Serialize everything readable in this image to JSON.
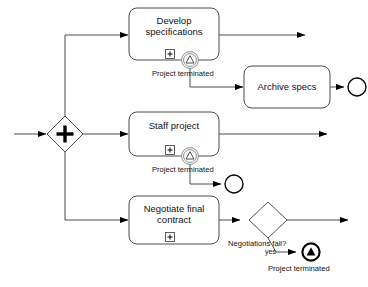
{
  "diagram": {
    "type": "bpmn-process"
  },
  "gateways": [
    {
      "id": "split",
      "name": "parallel-split-gateway",
      "kind": "parallel",
      "marker": "+",
      "label": ""
    },
    {
      "id": "neg_decision",
      "name": "negotiations-fail-gateway",
      "kind": "exclusive",
      "marker": "",
      "label": "Negotiations fail?"
    }
  ],
  "tasks": [
    {
      "id": "develop",
      "name": "develop-specifications-task",
      "label_line1": "Develop",
      "label_line2": "specifications",
      "marker": "+"
    },
    {
      "id": "archive",
      "name": "archive-specs-task",
      "label_line1": "Archive specs",
      "label_line2": "",
      "marker": ""
    },
    {
      "id": "staff",
      "name": "staff-project-task",
      "label_line1": "Staff project",
      "label_line2": "",
      "marker": "+"
    },
    {
      "id": "negotiate",
      "name": "negotiate-final-contract-task",
      "label_line1": "Negotiate final",
      "label_line2": "contract",
      "marker": "+"
    }
  ],
  "boundary_events": [
    {
      "id": "be1",
      "name": "boundary-event-develop-escalation",
      "glyph": "triangle-outline",
      "label": "Project terminated"
    },
    {
      "id": "be2",
      "name": "boundary-event-staff-escalation",
      "glyph": "triangle-outline",
      "label": "Project terminated"
    }
  ],
  "end_events": [
    {
      "id": "end_archive",
      "name": "end-event-archive",
      "style": "thin-circle",
      "label": ""
    },
    {
      "id": "end_staff",
      "name": "end-event-staff-terminated",
      "style": "thin-circle",
      "label": ""
    },
    {
      "id": "end_terminate",
      "name": "end-event-project-terminated",
      "style": "thick-circle-filled-triangle",
      "label": "Project terminated"
    }
  ],
  "sequence_flow_labels": [
    {
      "id": "yes",
      "name": "flow-label-yes",
      "text": "yes"
    }
  ],
  "colors": {
    "stroke": "#4d4d4d",
    "bold_stroke": "#000000",
    "text": "#111111",
    "fill": "#ffffff"
  }
}
